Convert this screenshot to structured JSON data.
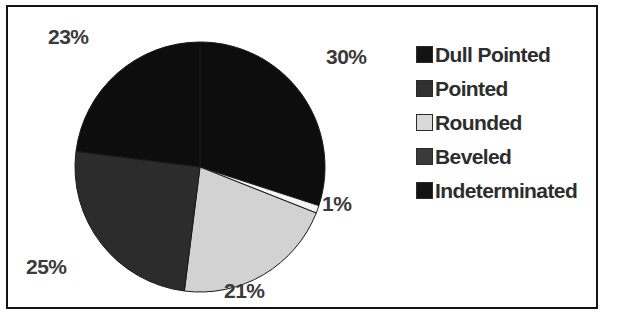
{
  "chart_data": {
    "type": "pie",
    "title": "",
    "subtitle": "",
    "xlabel": "",
    "ylabel": "",
    "grid": false,
    "legend_position": "right",
    "start_angle_deg": 0,
    "direction": "clockwise",
    "categories": [
      "Dull Pointed",
      "Pointed",
      "Rounded",
      "Beveled",
      "Indeterminated"
    ],
    "values": [
      30,
      25,
      21,
      1,
      23
    ],
    "value_unit": "%",
    "slices": [
      {
        "label": "Dull Pointed",
        "value": 30,
        "data_label": "30%",
        "color": "#0d0d0d",
        "start_deg": 0,
        "end_deg": 108
      },
      {
        "label": "Beveled",
        "value": 1,
        "data_label": "1%",
        "color": "#f4f4f4",
        "start_deg": 108,
        "end_deg": 111.6
      },
      {
        "label": "Rounded",
        "value": 21,
        "data_label": "21%",
        "color": "#d2d2d2",
        "start_deg": 111.6,
        "end_deg": 187.2
      },
      {
        "label": "Pointed",
        "value": 25,
        "data_label": "25%",
        "color": "#2c2c2c",
        "start_deg": 187.2,
        "end_deg": 277.2
      },
      {
        "label": "Indeterminated",
        "value": 23,
        "data_label": "23%",
        "color": "#0d0d0d",
        "start_deg": 277.2,
        "end_deg": 360
      }
    ],
    "data_labels": [
      "23%",
      "30%",
      "1%",
      "21%",
      "25%"
    ]
  },
  "legend": {
    "items": [
      {
        "label": "Dull Pointed",
        "color": "#131313"
      },
      {
        "label": "Pointed",
        "color": "#303030"
      },
      {
        "label": "Rounded",
        "color": "#d9d9d9"
      },
      {
        "label": "Beveled",
        "color": "#3a3a3a"
      },
      {
        "label": "Indeterminated",
        "color": "#131313"
      }
    ]
  },
  "labels": {
    "pct_top_left": "23%",
    "pct_top_right": "30%",
    "pct_right": "1%",
    "pct_bottom": "21%",
    "pct_left": "25%"
  },
  "colors": {
    "frame": "#141414",
    "background": "#ffffff",
    "text": "#2d2d2d"
  }
}
